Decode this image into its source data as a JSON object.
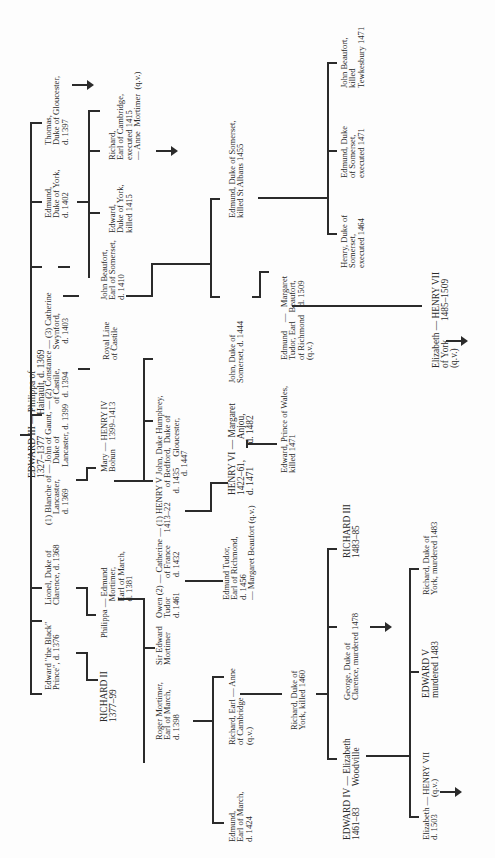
{
  "diagram": {
    "orientation": "rotated 90° counter-clockwise (read with page turned clockwise)",
    "nodes": {
      "edward_iii": "EDWARD III — Philippa of\n1327–1377         Hainault, d. 1369",
      "black_prince": "Edward \"the Black\"\nPrince\", d. 1376",
      "lionel": "Lionel, Duke of\nClarence, d. 1368",
      "blanche": "(1) Blanche of — John of Gaunt, — (2) Constance — (3) Catherine\n     Lancaster,       Duke of               of Castile,         Swynford,\n     d. 1369          Lancaster, d. 1399   d. 1394             d. 1403",
      "edmund_york": "Edmund,\nDuke of York,\nd. 1402",
      "thomas": "Thomas,\nDuke of Gloucester,\nd. 1397",
      "richard_ii": "RICHARD II\n1377–99",
      "philippa": "Philippa — Edmund\n                 Mortimer,\n                 Earl of March,\n                 d. 1381",
      "mary_bohun": "Mary — HENRY IV\nBohun    1399–1413",
      "royal_castile": "Royal Line\nof Castile",
      "john_beaufort": "John Beaufort,\nEarl of Somerset,\nd. 1410",
      "edward_york": "Edward,\nDuke of York,\nkilled 1415",
      "richard_cambridge_top": "Richard,\nEarl of Cambridge,\nexecuted 1415\n— Anne  Mortimer  (q.v.)",
      "sir_edward_mortimer": "Sir Edward\nMortimer",
      "owen_tudor": "Owen (2) — Catherine — (1) HENRY V John, Duke Humphrey,\nTudor         of France      1413–22       of Bedford,  Duke of\nd. 1461       d. 1432                           d. 1435     Gloucester,\n                                                                  d. 1447",
      "roger_mortimer": "Roger Mortimer,\nEarl of March,\nd. 1398",
      "edmund_tudor": "Edmund Tudor,\nEarl of Richmond,\nd. 1456\n— Margaret Beaufort (q.v.)",
      "henry_vi": "HENRY VI — Margaret\n1422–61,         Anjou,\nd. 1471          d. 1482",
      "john_somerset": "John, Duke of\nSomerset, d. 1444",
      "edmund_somerset": "Edmund, Duke of Somerset,\nkilled St Albans 1455",
      "edward_prince_wales": "Edward, Prince of Wales,\nkilled 1471",
      "edmund_tudor_margaret": "Edmund    —   Margaret\nTudor, Earl    Beaufort,\nof Richmond    d. 1509\n(q.v.)",
      "henry_somerset": "Henry, Duke of\nSomerset,\nexecuted 1464",
      "edmund_duke_somerset": "Edmund, Duke\nof Somerset,\nexecuted 1471",
      "john_beaufort_killed": "John Beaufort,\nkilled\nTewkesbury 1471",
      "elizabeth_henry_vii": "Elizabeth — HENRY VII\nof York        1485–1509\n(q.v.)",
      "edmund_march": "Edmund,\nEarl of March,\nd. 1424",
      "richard_cambridge": "Richard, Earl — Anne\nof Cambridge\n(q.v.)",
      "richard_york": "Richard, Duke of\nYork, killed 1460",
      "edward_iv": "EDWARD IV — Elizabeth\n1461–83         Woodville",
      "george_clarence": "George, Duke of\nClarence, murdered 1478",
      "richard_iii": "RICHARD III\n1483–85",
      "elizabeth_1503": "Elizabeth — HENRY VII\nd. 1503        (q.v.)",
      "edward_v": "EDWARD V\nmurdered 1483",
      "richard_york_1483": "Richard, Duke of\nYork, murdered 1483"
    }
  }
}
